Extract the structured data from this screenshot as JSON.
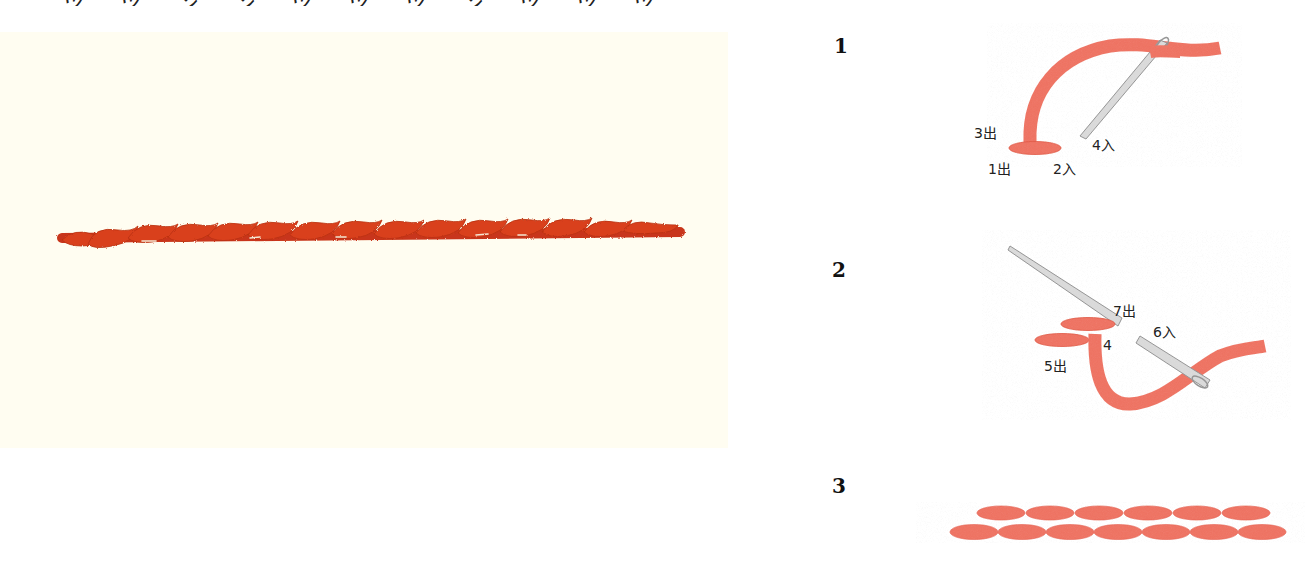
{
  "header": {
    "cut_text": "ツ ツ ン ン ツ ツ ツ ン ツ ツ ツ"
  },
  "photo": {
    "description": "embroidered twisted stem stitch sample",
    "stitch_color": "#d9401e",
    "stitch_shadow": "#b8300f",
    "fabric_color": "#fffdf1"
  },
  "steps": [
    {
      "number": "1",
      "labels": {
        "a": "3出",
        "b": "1出",
        "c": "2入",
        "d": "4入"
      }
    },
    {
      "number": "2",
      "labels": {
        "a": "7出",
        "b": "6入",
        "c": "4",
        "d": "5出"
      }
    },
    {
      "number": "3",
      "labels": {}
    }
  ],
  "colors": {
    "thread": "#f07a6b",
    "thread_dark": "#e2604f",
    "needle": "#d8d8d8",
    "needle_edge": "#9a9a9a"
  }
}
